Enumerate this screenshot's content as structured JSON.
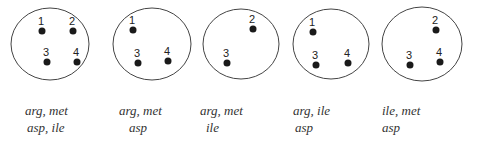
{
  "diagrams": [
    {
      "cx": 50,
      "cy": 44,
      "r": 39,
      "dots": [
        {
          "n": "1",
          "x": 42,
          "y": 31
        },
        {
          "n": "2",
          "x": 73,
          "y": 31
        },
        {
          "n": "3",
          "x": 47,
          "y": 62
        },
        {
          "n": "4",
          "x": 77,
          "y": 62
        }
      ],
      "line1": "arg, met",
      "line2": "asp, ile"
    },
    {
      "cx": 152,
      "cy": 44,
      "r": 39,
      "dots": [
        {
          "n": "1",
          "x": 133,
          "y": 30
        },
        {
          "n": "3",
          "x": 138,
          "y": 63
        },
        {
          "n": "4",
          "x": 168,
          "y": 61
        }
      ],
      "line1": "arg, met",
      "line2": "asp"
    },
    {
      "cx": 241,
      "cy": 44,
      "r": 38,
      "dots": [
        {
          "n": "2",
          "x": 253,
          "y": 29
        },
        {
          "n": "3",
          "x": 227,
          "y": 63
        }
      ],
      "line1": "arg, met",
      "line2": "ile"
    },
    {
      "cx": 331,
      "cy": 44,
      "r": 38,
      "dots": [
        {
          "n": "1",
          "x": 313,
          "y": 32
        },
        {
          "n": "3",
          "x": 316,
          "y": 65
        },
        {
          "n": "4",
          "x": 348,
          "y": 63
        }
      ],
      "line1": "arg, ile",
      "line2": "asp"
    },
    {
      "cx": 422,
      "cy": 44,
      "r": 40,
      "dots": [
        {
          "n": "2",
          "x": 436,
          "y": 30
        },
        {
          "n": "3",
          "x": 410,
          "y": 65
        },
        {
          "n": "4",
          "x": 440,
          "y": 62
        }
      ],
      "line1": "ile, met",
      "line2": "asp"
    }
  ]
}
